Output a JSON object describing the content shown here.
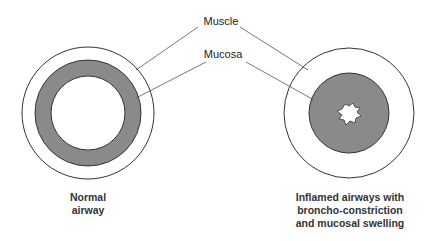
{
  "labels": {
    "muscle": "Muscle",
    "mucosa": "Mucosa"
  },
  "captions": {
    "normal_line1": "Normal",
    "normal_line2": "airway",
    "inflamed_line1": "Inflamed airways with",
    "inflamed_line2": "broncho-constriction",
    "inflamed_line3": "and mucosal swelling"
  },
  "colors": {
    "mucosa_fill": "#8a8a8a",
    "outline": "#333333",
    "background": "#ffffff"
  }
}
